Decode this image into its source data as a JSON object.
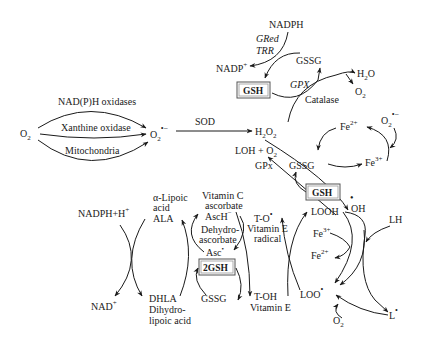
{
  "diagram": {
    "sources": {
      "o2_left": "O",
      "o2_left_sub": "2",
      "nadph_oxidases": "NAD(P)H oxidases",
      "xanthine_oxidase": "Xanthine oxidase",
      "mitochondria": "Mitochondria",
      "superoxide": "O",
      "superoxide_sub": "2",
      "superoxide_sup": "•−"
    },
    "sod": "SOD",
    "h2o2": {
      "main": "H",
      "sub1": "2",
      "mid": "O",
      "sub2": "2"
    },
    "top_cycle": {
      "nadph": "NADPH",
      "gred": "GRed",
      "trr": "TRR",
      "nadp": "NADP",
      "nadp_sup": "+",
      "gssg": "GSSG",
      "gsh": "GSH",
      "gpx": "GPX",
      "catalase": "Catalase",
      "h2o": "H",
      "h2o_sub": "2",
      "h2o_o": "O",
      "o2": "O",
      "o2_sub": "2"
    },
    "fenton": {
      "fe2": "Fe",
      "fe2_sup": "2+",
      "fe3": "Fe",
      "fe3_sup": "3+",
      "superoxide": "O",
      "superoxide_sub": "2",
      "superoxide_sup": "•−"
    },
    "middle": {
      "loh_o2": "LOH + O",
      "loh_o2_sub": "2",
      "gpx": "GPx",
      "gssg": "GSSG",
      "gsh": "GSH",
      "oh_radical": "OH",
      "oh_dot": "•"
    },
    "lower_left": {
      "nadph_h": "NADPH+H",
      "nadph_h_sup": "+",
      "nad": "NAD",
      "nad_sup": "+",
      "lipoic_acid_1": "α-Lipoic",
      "lipoic_acid_2": "acid",
      "ala": "ALA",
      "dhla": "DHLA",
      "dihydro_1": "Dihydro-",
      "dihydro_2": "lipoic acid",
      "vitc_1": "Vitamin C",
      "vitc_2": "ascorbate",
      "asch": "AscH",
      "asch_sup": "−",
      "dehydro_1": "Dehydro-",
      "dehydro_2": "ascorbate",
      "asc": "Asc",
      "asc_sup": "•",
      "two_gsh": "2GSH",
      "gssg": "GSSG"
    },
    "vitamin_e": {
      "to_radical": "T-O",
      "to_dot": "•",
      "vite_radical_1": "Vitamin E",
      "vite_radical_2": "radical",
      "toh": "T-OH",
      "vite": "Vitamin E"
    },
    "lipid": {
      "looh": "LOOH",
      "fe3": "Fe",
      "fe3_sup": "3+",
      "fe2": "Fe",
      "fe2_sup": "2+",
      "loo": "LOO",
      "loo_dot": "•",
      "lh": "LH",
      "l_radical": "L",
      "l_dot": "•",
      "o2": "O",
      "o2_sub": "2"
    }
  }
}
